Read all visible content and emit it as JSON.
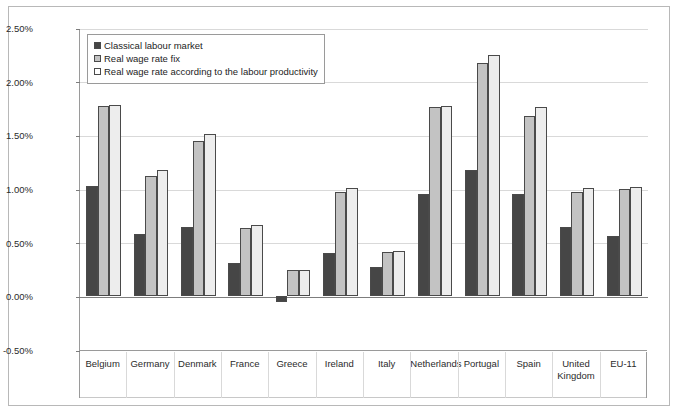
{
  "chart_data": {
    "type": "bar",
    "title": "",
    "subtitle": "",
    "xlabel": "",
    "ylabel": "",
    "ylim": [
      -0.5,
      2.5
    ],
    "ytick_labels": [
      "2.50%",
      "2.00%",
      "1.50%",
      "1.00%",
      "0.50%",
      "0.00%",
      "-0.50%"
    ],
    "ytick_values": [
      2.5,
      2.0,
      1.5,
      1.0,
      0.5,
      0.0,
      -0.5
    ],
    "value_format": "percent",
    "grid": true,
    "legend_position": "top-left",
    "categories": [
      "Belgium",
      "Germany",
      "Denmark",
      "France",
      "Greece",
      "Ireland",
      "Italy",
      "Netherlands",
      "Portugal",
      "Spain",
      "United\nKingdom",
      "EU-11"
    ],
    "series": [
      {
        "name": "Classical labour market",
        "color": "#464646",
        "values": [
          1.03,
          0.58,
          0.65,
          0.31,
          -0.05,
          0.4,
          0.27,
          0.95,
          1.18,
          0.95,
          0.65,
          0.56
        ]
      },
      {
        "name": "Real wage rate fix",
        "color": "#c3c3c3",
        "values": [
          1.77,
          1.12,
          1.45,
          0.64,
          0.25,
          0.97,
          0.41,
          1.76,
          2.17,
          1.68,
          0.97,
          1.0
        ]
      },
      {
        "name": "Real wage rate according to the labour productivity",
        "color": "#ededed",
        "values": [
          1.78,
          1.18,
          1.51,
          0.66,
          0.25,
          1.01,
          0.42,
          1.77,
          2.25,
          1.76,
          1.01,
          1.02
        ]
      }
    ]
  },
  "legend": {
    "items": [
      "Classical labour market",
      "Real wage rate fix",
      "Real wage rate according to the labour productivity"
    ]
  }
}
